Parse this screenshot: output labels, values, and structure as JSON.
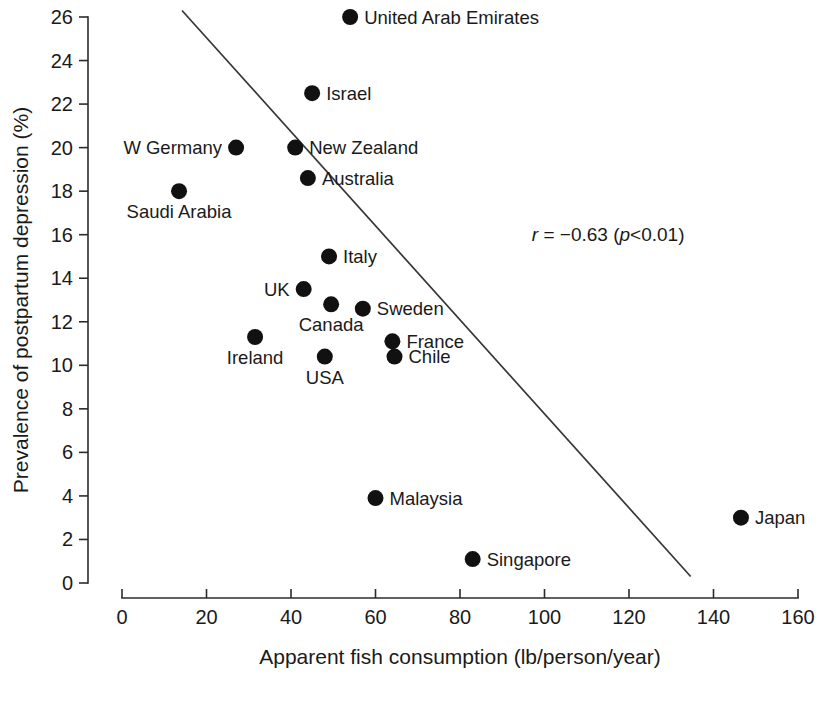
{
  "chart_data": {
    "type": "scatter",
    "title": "",
    "xlabel": "Apparent fish consumption (lb/person/year)",
    "ylabel": "Prevalence of postpartum depression (%)",
    "xlim": [
      0,
      160
    ],
    "ylim": [
      0,
      26
    ],
    "xticks": [
      0,
      20,
      40,
      60,
      80,
      100,
      120,
      140,
      160
    ],
    "yticks": [
      0,
      2,
      4,
      6,
      8,
      10,
      12,
      14,
      16,
      18,
      20,
      22,
      24,
      26
    ],
    "xtick_labels": [
      "0",
      "20",
      "40",
      "60",
      "80",
      "100",
      "120",
      "140",
      "160"
    ],
    "ytick_labels": [
      "0",
      "2",
      "4",
      "6",
      "8",
      "10",
      "12",
      "14",
      "16",
      "18",
      "20",
      "22",
      "24",
      "26"
    ],
    "grid": false,
    "legend": "none",
    "points": [
      {
        "label": "United Arab Emirates",
        "x": 54.0,
        "y": 26.0,
        "label_side": "right"
      },
      {
        "label": "Israel",
        "x": 45.0,
        "y": 22.5,
        "label_side": "right"
      },
      {
        "label": "W Germany",
        "x": 27.0,
        "y": 20.0,
        "label_side": "left"
      },
      {
        "label": "New Zealand",
        "x": 41.0,
        "y": 20.0,
        "label_side": "right"
      },
      {
        "label": "Australia",
        "x": 44.0,
        "y": 18.6,
        "label_side": "right"
      },
      {
        "label": "Saudi Arabia",
        "x": 13.5,
        "y": 18.0,
        "label_side": "below"
      },
      {
        "label": "Italy",
        "x": 49.0,
        "y": 15.0,
        "label_side": "right"
      },
      {
        "label": "UK",
        "x": 43.0,
        "y": 13.5,
        "label_side": "left"
      },
      {
        "label": "Canada",
        "x": 49.5,
        "y": 12.8,
        "label_side": "below"
      },
      {
        "label": "Sweden",
        "x": 57.0,
        "y": 12.6,
        "label_side": "right"
      },
      {
        "label": "Ireland",
        "x": 31.5,
        "y": 11.3,
        "label_side": "below"
      },
      {
        "label": "France",
        "x": 64.0,
        "y": 11.1,
        "label_side": "right"
      },
      {
        "label": "USA",
        "x": 48.0,
        "y": 10.4,
        "label_side": "below"
      },
      {
        "label": "Chile",
        "x": 64.5,
        "y": 10.4,
        "label_side": "right"
      },
      {
        "label": "Malaysia",
        "x": 60.0,
        "y": 3.9,
        "label_side": "right"
      },
      {
        "label": "Japan",
        "x": 146.5,
        "y": 3.0,
        "label_side": "right"
      },
      {
        "label": "Singapore",
        "x": 83.0,
        "y": 1.1,
        "label_side": "right"
      }
    ],
    "regression_line": {
      "x_start": 14.2,
      "y_start": 26.3,
      "x_end": 134.6,
      "y_end": 0.3
    },
    "annotation": {
      "full_text": "r = −0.63 (p<0.01)",
      "r_symbol": "r",
      "r_value": " = −0.63 (",
      "p_symbol": "p",
      "p_value": "<0.01)",
      "x": 97.0,
      "y": 15.7
    }
  },
  "colors": {
    "marker": "#111111",
    "axis": "#2b2b2b",
    "line": "#35353a",
    "text": "#1a1a1a",
    "background": "#ffffff"
  }
}
